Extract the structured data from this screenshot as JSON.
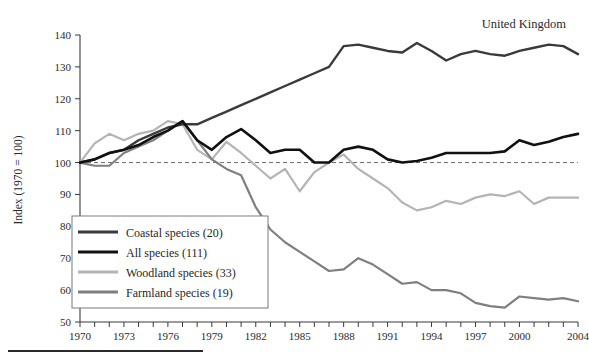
{
  "figure": {
    "region_label": "United Kingdom",
    "title_partial": "",
    "background": "#ffffff"
  },
  "axes": {
    "y_axis_title": "Index (1970 = 100)",
    "y_ticks": [
      50,
      60,
      70,
      80,
      90,
      100,
      110,
      120,
      130,
      140
    ],
    "y_min": 50,
    "y_max": 140,
    "x_min": 1970,
    "x_max": 2004,
    "x_tick_labels": [
      "1970",
      "1973",
      "1976",
      "1979",
      "1982",
      "1985",
      "1988",
      "1991",
      "1994",
      "1997",
      "2000",
      "2004"
    ],
    "x_tick_label_years": [
      1970,
      1973,
      1976,
      1979,
      1982,
      1985,
      1988,
      1991,
      1994,
      1997,
      2000,
      2004
    ],
    "reference_line_value": 100,
    "grid": false
  },
  "legend": {
    "position": "bottom-left",
    "entries": [
      {
        "label": "Coastal species (20)",
        "color": "#3a3a3a",
        "width": 2.4
      },
      {
        "label": "All species (111)",
        "color": "#111111",
        "width": 2.6
      },
      {
        "label": "Woodland species (33)",
        "color": "#b4b4b4",
        "width": 2.2
      },
      {
        "label": "Farmland species (19)",
        "color": "#7f7f7f",
        "width": 2.2
      }
    ]
  },
  "chart_data": {
    "type": "line",
    "title": "",
    "subtitle": "",
    "xlabel": "",
    "ylabel": "Index (1970 = 100)",
    "xlim": [
      1970,
      2004
    ],
    "ylim": [
      50,
      140
    ],
    "grid": false,
    "legend_position": "bottom-left",
    "annotations": [
      "United Kingdom"
    ],
    "reference_lines": [
      {
        "y": 100,
        "style": "dashed"
      }
    ],
    "x": [
      1970,
      1971,
      1972,
      1973,
      1974,
      1975,
      1976,
      1977,
      1978,
      1979,
      1980,
      1981,
      1982,
      1983,
      1984,
      1985,
      1986,
      1987,
      1988,
      1989,
      1990,
      1991,
      1992,
      1993,
      1994,
      1995,
      1996,
      1997,
      1998,
      1999,
      2000,
      2001,
      2002,
      2003,
      2004
    ],
    "series": [
      {
        "name": "Coastal species (20)",
        "color": "#3a3a3a",
        "values": [
          100,
          101,
          103,
          104,
          107,
          109,
          111,
          112,
          112,
          114,
          116,
          118,
          120,
          122,
          124,
          126,
          128,
          130,
          136.5,
          137,
          136,
          135,
          134.5,
          137.5,
          135,
          132,
          134,
          135,
          134,
          133.5,
          135,
          136,
          137,
          136.5,
          134
        ]
      },
      {
        "name": "All species (111)",
        "color": "#111111",
        "values": [
          100,
          101,
          103,
          104,
          105.5,
          108,
          110,
          113,
          107,
          104,
          108,
          110.5,
          107,
          103,
          104,
          104,
          100,
          100,
          104,
          105,
          104,
          101,
          100,
          100.5,
          101.5,
          103,
          103,
          103,
          103,
          103.5,
          107,
          105.5,
          106.5,
          108,
          109
        ]
      },
      {
        "name": "Woodland species (33)",
        "color": "#b4b4b4",
        "values": [
          100,
          106,
          109,
          107,
          109,
          110,
          113,
          112,
          104,
          101,
          106.5,
          103,
          99,
          95,
          98,
          91,
          97,
          100,
          102.5,
          98,
          95,
          92,
          87.5,
          85,
          86,
          88,
          87,
          89,
          90,
          89.5,
          91,
          87,
          89,
          89,
          89
        ]
      },
      {
        "name": "Farmland species (19)",
        "color": "#7f7f7f",
        "values": [
          100,
          99,
          99,
          103,
          105,
          107,
          110,
          113,
          107,
          101,
          98,
          96,
          86,
          79,
          75,
          72,
          69,
          66,
          66.5,
          70,
          68,
          65,
          62,
          62.5,
          60,
          60,
          59,
          56,
          55,
          54.5,
          58,
          57.5,
          57,
          57.5,
          56.5
        ]
      }
    ]
  }
}
